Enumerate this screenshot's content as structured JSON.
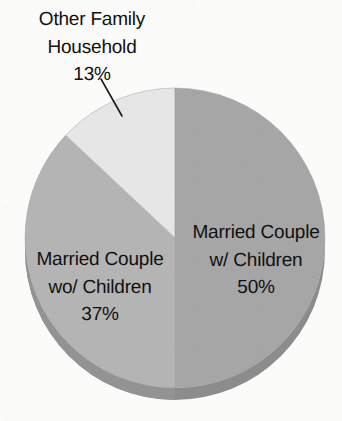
{
  "figure": {
    "kind": "pie-chart",
    "background_color": "#fbfbfa",
    "text_color": "#111111"
  },
  "chart_data": {
    "type": "pie",
    "title": "",
    "subtitle": "",
    "xlabel": "",
    "ylabel": "",
    "grid": false,
    "legend_position": "none",
    "label_format": "name + percent",
    "start_angle_deg": 0,
    "direction": "clockwise",
    "three_d": true,
    "categories": [
      "Married Couple w/ Children",
      "Married Couple wo/ Children",
      "Other Family Household"
    ],
    "values": [
      50,
      37,
      13
    ],
    "value_labels": [
      "50%",
      "37%",
      "13%"
    ],
    "unit": "%",
    "total": 100,
    "colors": [
      "#a6a6a6",
      "#b4b4b4",
      "#e6e6e6"
    ],
    "slices": [
      {
        "name": "Married Couple w/ Children",
        "value": 50,
        "value_label": "50%",
        "color": "#a6a6a6",
        "start_deg": 0,
        "end_deg": 180,
        "label_placement": "inside"
      },
      {
        "name": "Married Couple wo/ Children",
        "value": 37,
        "value_label": "37%",
        "color": "#b4b4b4",
        "start_deg": 180,
        "end_deg": 313.2,
        "label_placement": "inside"
      },
      {
        "name": "Other Family Household",
        "value": 13,
        "value_label": "13%",
        "color": "#e6e6e6",
        "start_deg": 313.2,
        "end_deg": 360,
        "label_placement": "outside-with-leader"
      }
    ]
  },
  "labels": {
    "other_family": {
      "line1": "Other Family",
      "line2": "Household",
      "line3": "13%"
    },
    "married_with_children": {
      "line1": "Married Couple",
      "line2": "w/ Children",
      "line3": "50%"
    },
    "married_without_children": {
      "line1": "Married Couple",
      "line2": "wo/ Children",
      "line3": "37%"
    }
  }
}
